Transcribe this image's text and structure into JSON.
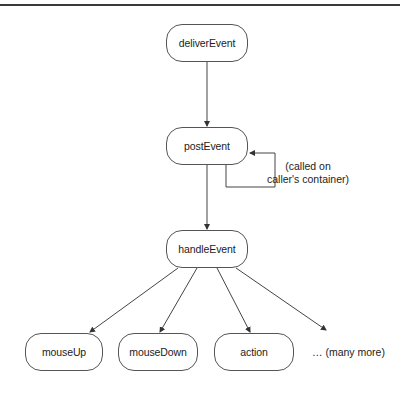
{
  "diagram": {
    "nodes": [
      {
        "id": "deliverEvent",
        "label": "deliverEvent",
        "x": 166,
        "y": 24,
        "w": 82,
        "h": 38
      },
      {
        "id": "postEvent",
        "label": "postEvent",
        "x": 166,
        "y": 127,
        "w": 82,
        "h": 38
      },
      {
        "id": "handleEvent",
        "label": "handleEvent",
        "x": 166,
        "y": 230,
        "w": 82,
        "h": 38
      },
      {
        "id": "mouseUp",
        "label": "mouseUp",
        "x": 25,
        "y": 333,
        "w": 78,
        "h": 38
      },
      {
        "id": "mouseDown",
        "label": "mouseDown",
        "x": 118,
        "y": 333,
        "w": 80,
        "h": 38
      },
      {
        "id": "action",
        "label": "action",
        "x": 214,
        "y": 333,
        "w": 80,
        "h": 38
      }
    ],
    "more_label": "… (many more)",
    "self_loop_label_line1": "(called on",
    "self_loop_label_line2": "caller's container)",
    "edges": [
      {
        "from": "deliverEvent",
        "to": "postEvent"
      },
      {
        "from": "postEvent",
        "to": "postEvent",
        "note": "self-loop"
      },
      {
        "from": "postEvent",
        "to": "handleEvent"
      },
      {
        "from": "handleEvent",
        "to": "mouseUp"
      },
      {
        "from": "handleEvent",
        "to": "mouseDown"
      },
      {
        "from": "handleEvent",
        "to": "action"
      },
      {
        "from": "handleEvent",
        "to": "many-more"
      }
    ],
    "colors": {
      "line": "#444444",
      "border": "#555555",
      "text": "#222222",
      "rule": "#3a3a3a"
    }
  }
}
